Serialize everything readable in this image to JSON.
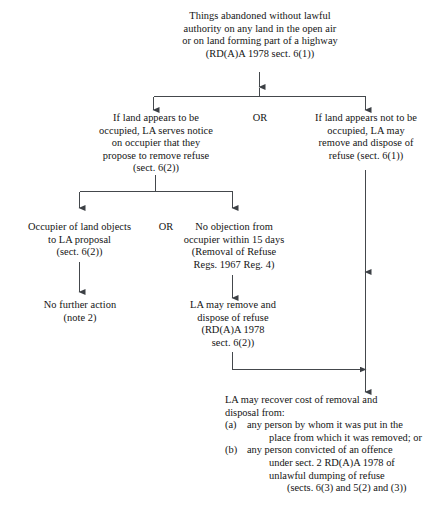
{
  "diagram": {
    "line_color": "#44484c",
    "text_color": "#141414",
    "background": "#ffffff"
  },
  "nodes": {
    "start": {
      "name": "abandoned-things",
      "lines": [
        "Things abandoned without lawful",
        "authority on any land in the open air",
        "or on land forming part of a highway",
        "(RD(A)A 1978 sect. 6(1))"
      ]
    },
    "occupied_branch": {
      "name": "land-appears-occupied",
      "lines": [
        "If land appears to be",
        "occupied, LA serves notice",
        "on occupier that they",
        "propose to remove refuse",
        "(sect. 6(2))"
      ]
    },
    "not_occupied_branch": {
      "name": "land-appears-not-occupied",
      "lines": [
        "If land appears not to be",
        "occupied, LA may",
        "remove and dispose of",
        "refuse (sect. 6(1))"
      ]
    },
    "objects": {
      "name": "occupier-objects",
      "lines": [
        "Occupier of land objects",
        "to LA proposal",
        "(sect. 6(2))"
      ]
    },
    "no_objection": {
      "name": "no-objection",
      "lines": [
        "No objection from",
        "occupier within 15 days",
        "(Removal of Refuse",
        "Regs. 1967 Reg. 4)"
      ]
    },
    "no_further_action": {
      "name": "no-further-action",
      "lines": [
        "No further action",
        "(note 2)"
      ]
    },
    "la_remove": {
      "name": "la-may-remove-dispose",
      "lines": [
        "LA may remove and",
        "dispose of refuse",
        "(RD(A)A 1978",
        "sect. 6(2))"
      ]
    },
    "recover": {
      "name": "la-may-recover-cost",
      "lead": [
        "LA may recover cost of removal and",
        "disposal from:"
      ],
      "items": [
        {
          "marker": "(a)",
          "lines": [
            "any person by whom it was put in the",
            "place from which it was removed; or"
          ]
        },
        {
          "marker": "(b)",
          "lines": [
            "any person convicted of an offence",
            "under sect. 2 RD(A)A 1978 of",
            "unlawful dumping of refuse"
          ]
        }
      ],
      "footer": "(sects. 6(3) and 5(2) and (3))"
    }
  },
  "connectors": {
    "or_top": "OR",
    "or_middle": "OR"
  }
}
